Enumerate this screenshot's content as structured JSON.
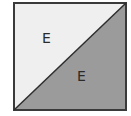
{
  "diagram": {
    "shape": "square split by diagonal",
    "colors": {
      "light_region": "#efefef",
      "dark_region": "#9b9b9b",
      "stroke": "#3a3a3a"
    },
    "regions": [
      {
        "name": "upper-left-triangle",
        "label": "E"
      },
      {
        "name": "lower-right-triangle",
        "label": "E"
      }
    ]
  }
}
